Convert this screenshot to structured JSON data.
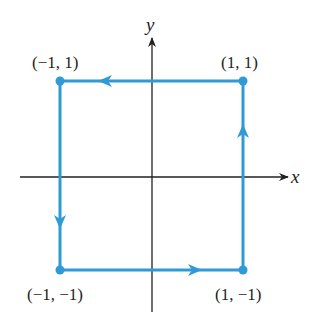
{
  "diagram": {
    "axes": {
      "x_label": "x",
      "y_label": "y"
    },
    "path_color": "#2e9ad6",
    "axis_color": "#231f20",
    "vertices": [
      {
        "label": "(1, 1)",
        "x": 1,
        "y": 1
      },
      {
        "label": "(-1, 1)",
        "x": -1,
        "y": 1
      },
      {
        "label": "(-1, -1)",
        "x": -1,
        "y": -1
      },
      {
        "label": "(1, -1)",
        "x": 1,
        "y": -1
      }
    ],
    "vertex_labels": {
      "top_left": "(−1, 1)",
      "top_right": "(1, 1)",
      "bottom_left": "(−1, −1)",
      "bottom_right": "(1, −1)"
    },
    "orientation": "counterclockwise",
    "edge_arrows": [
      "left on top edge",
      "down on left edge",
      "right on bottom edge",
      "up on right edge"
    ]
  }
}
